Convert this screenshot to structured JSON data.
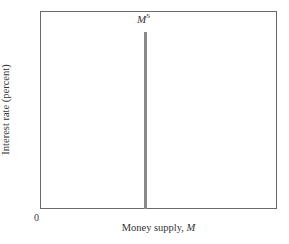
{
  "chart_data": {
    "type": "line",
    "title": "",
    "xlabel": "Money supply, M",
    "ylabel": "Interest rate (percent)",
    "origin_label": "0",
    "grid": false,
    "legend": null,
    "series": [
      {
        "name": "M^S",
        "label_main": "M",
        "label_sup": "S",
        "description": "Vertical money supply curve at fixed quantity",
        "x": [
          0.44,
          0.44
        ],
        "y": [
          0.0,
          0.9
        ]
      }
    ],
    "xlim": [
      0,
      1
    ],
    "ylim": [
      0,
      1
    ]
  },
  "axes": {
    "x_label_text": "Money supply, ",
    "x_label_var": "M",
    "y_label": "Interest rate (percent)",
    "origin": "0"
  },
  "curve": {
    "label_main": "M",
    "label_sup": "S"
  }
}
